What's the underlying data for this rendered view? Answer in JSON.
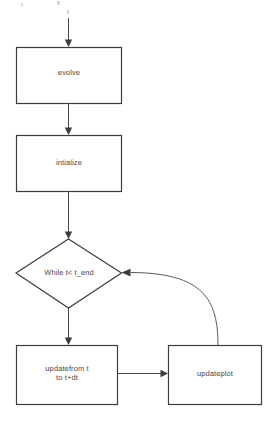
{
  "diagram": {
    "background_color": "#ffffff",
    "stroke_color": "#3c3c3c",
    "text_color": "#4a4a4a",
    "nodes": [
      {
        "id": "evolve",
        "shape": "rectangle",
        "label": "evolve"
      },
      {
        "id": "intialize",
        "shape": "rectangle",
        "label": "intialize"
      },
      {
        "id": "while",
        "shape": "diamond",
        "label": "While t< t_end"
      },
      {
        "id": "update",
        "shape": "rectangle",
        "label": "updatefrom t\nto t+dt"
      },
      {
        "id": "updateplot",
        "shape": "rectangle",
        "label": "updateplot"
      }
    ],
    "edges": [
      {
        "from": "start",
        "to": "evolve",
        "style": "straight-down",
        "label": ""
      },
      {
        "from": "evolve",
        "to": "intialize",
        "style": "straight-down",
        "label": ""
      },
      {
        "from": "intialize",
        "to": "while",
        "style": "straight-down",
        "label": ""
      },
      {
        "from": "while",
        "to": "update",
        "style": "straight-down",
        "label": ""
      },
      {
        "from": "update",
        "to": "updateplot",
        "style": "straight-right",
        "label": ""
      },
      {
        "from": "updateplot",
        "to": "while",
        "style": "curved-feedback",
        "label": ""
      }
    ]
  }
}
